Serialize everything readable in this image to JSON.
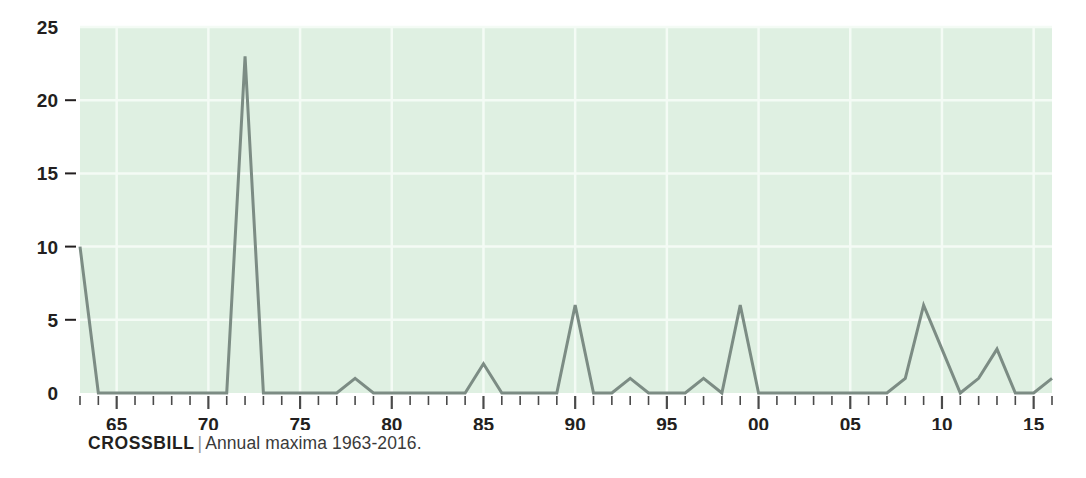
{
  "caption": {
    "series_name": "CROSSBILL",
    "separator": "|",
    "subtitle": "Annual maxima 1963-2016."
  },
  "colors": {
    "plot_background": "#dff0e2",
    "gridline": "#f4fbf5",
    "line": "#7c8c84",
    "axis_text": "#231f20",
    "tick": "#4a4a4a",
    "caption_separator": "#9a9a9a"
  },
  "chart_data": {
    "type": "line",
    "title": "CROSSBILL",
    "subtitle": "Annual maxima 1963-2016.",
    "xlabel": "",
    "ylabel": "",
    "grid": true,
    "legend": "none",
    "xlim": [
      1963,
      2016
    ],
    "ylim": [
      0,
      25
    ],
    "yticks": [
      0,
      5,
      10,
      15,
      20,
      25
    ],
    "ytick_labels": [
      "0",
      "5",
      "10",
      "15",
      "20",
      "25"
    ],
    "xtick_labels": [
      "65",
      "70",
      "75",
      "80",
      "85",
      "90",
      "95",
      "00",
      "05",
      "10",
      "15"
    ],
    "xtick_values": [
      1965,
      1970,
      1975,
      1980,
      1985,
      1990,
      1995,
      2000,
      2005,
      2010,
      2015
    ],
    "minor_xticks_every": 1,
    "x": [
      1963,
      1964,
      1965,
      1966,
      1967,
      1968,
      1969,
      1970,
      1971,
      1972,
      1973,
      1974,
      1975,
      1976,
      1977,
      1978,
      1979,
      1980,
      1981,
      1982,
      1983,
      1984,
      1985,
      1986,
      1987,
      1988,
      1989,
      1990,
      1991,
      1992,
      1993,
      1994,
      1995,
      1996,
      1997,
      1998,
      1999,
      2000,
      2001,
      2002,
      2003,
      2004,
      2005,
      2006,
      2007,
      2008,
      2009,
      2010,
      2011,
      2012,
      2013,
      2014,
      2015,
      2016
    ],
    "values": [
      10,
      0,
      0,
      0,
      0,
      0,
      0,
      0,
      0,
      23,
      0,
      0,
      0,
      0,
      0,
      1,
      0,
      0,
      0,
      0,
      0,
      0,
      2,
      0,
      0,
      0,
      0,
      6,
      0,
      0,
      1,
      0,
      0,
      0,
      1,
      0,
      6,
      0,
      0,
      0,
      0,
      0,
      0,
      0,
      0,
      1,
      6,
      3,
      0,
      1,
      3,
      0,
      0,
      1
    ],
    "series": [
      {
        "name": "CROSSBILL",
        "values": [
          10,
          0,
          0,
          0,
          0,
          0,
          0,
          0,
          0,
          23,
          0,
          0,
          0,
          0,
          0,
          1,
          0,
          0,
          0,
          0,
          0,
          0,
          2,
          0,
          0,
          0,
          0,
          6,
          0,
          0,
          1,
          0,
          0,
          0,
          1,
          0,
          6,
          0,
          0,
          0,
          0,
          0,
          0,
          0,
          0,
          1,
          6,
          3,
          0,
          1,
          3,
          0,
          0,
          1
        ]
      }
    ]
  }
}
